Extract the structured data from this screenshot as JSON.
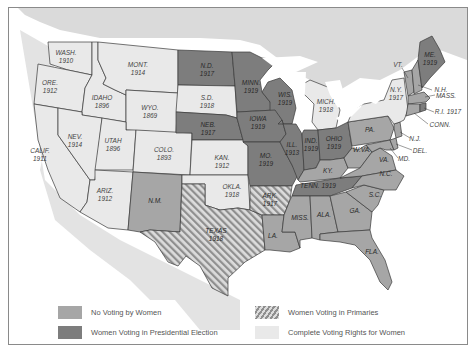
{
  "map": {
    "title": "Women's Suffrage in the United States before 1920",
    "colors": {
      "background": "#ffffff",
      "land_outside": "#d9d9d9",
      "water": "#ffffff",
      "no_voting": "#a6a6a6",
      "presidential": "#7d7d7d",
      "primaries_base": "#d0d0d0",
      "primaries_stripe": "#8f8f8f",
      "complete": "#e9e9e9",
      "border": "#3a3a3a"
    },
    "states": [
      {
        "abbr": "WASH.",
        "year": "1910",
        "status": "complete"
      },
      {
        "abbr": "ORE.",
        "year": "1912",
        "status": "complete"
      },
      {
        "abbr": "CALIF.",
        "year": "1911",
        "status": "complete"
      },
      {
        "abbr": "IDAHO",
        "year": "1896",
        "status": "complete"
      },
      {
        "abbr": "NEV.",
        "year": "1914",
        "status": "complete"
      },
      {
        "abbr": "MONT.",
        "year": "1914",
        "status": "complete"
      },
      {
        "abbr": "WYO.",
        "year": "1869",
        "status": "complete"
      },
      {
        "abbr": "UTAH",
        "year": "1896",
        "status": "complete"
      },
      {
        "abbr": "COLO.",
        "year": "1893",
        "status": "complete"
      },
      {
        "abbr": "ARIZ.",
        "year": "1912",
        "status": "complete"
      },
      {
        "abbr": "N.M.",
        "year": "",
        "status": "no_voting"
      },
      {
        "abbr": "N.D.",
        "year": "1917",
        "status": "presidential"
      },
      {
        "abbr": "S.D.",
        "year": "1918",
        "status": "complete"
      },
      {
        "abbr": "NEB.",
        "year": "1917",
        "status": "presidential"
      },
      {
        "abbr": "KAN.",
        "year": "1912",
        "status": "complete"
      },
      {
        "abbr": "OKLA.",
        "year": "1918",
        "status": "complete"
      },
      {
        "abbr": "TEXAS",
        "year": "1918",
        "status": "primaries"
      },
      {
        "abbr": "MINN.",
        "year": "1919",
        "status": "presidential"
      },
      {
        "abbr": "IOWA",
        "year": "1919",
        "status": "presidential"
      },
      {
        "abbr": "MO.",
        "year": "1919",
        "status": "presidential"
      },
      {
        "abbr": "ARK.",
        "year": "1917",
        "status": "primaries"
      },
      {
        "abbr": "LA.",
        "year": "",
        "status": "no_voting"
      },
      {
        "abbr": "WIS.",
        "year": "1919",
        "status": "presidential"
      },
      {
        "abbr": "ILL.",
        "year": "1913",
        "status": "presidential"
      },
      {
        "abbr": "MICH.",
        "year": "1918",
        "status": "complete"
      },
      {
        "abbr": "IND.",
        "year": "1919",
        "status": "presidential"
      },
      {
        "abbr": "OHIO",
        "year": "1919",
        "status": "presidential"
      },
      {
        "abbr": "KY.",
        "year": "",
        "status": "no_voting"
      },
      {
        "abbr": "TENN.",
        "year": "1919",
        "status": "presidential"
      },
      {
        "abbr": "MISS.",
        "year": "",
        "status": "no_voting"
      },
      {
        "abbr": "ALA.",
        "year": "",
        "status": "no_voting"
      },
      {
        "abbr": "GA.",
        "year": "",
        "status": "no_voting"
      },
      {
        "abbr": "FLA.",
        "year": "",
        "status": "no_voting"
      },
      {
        "abbr": "S.C.",
        "year": "",
        "status": "no_voting"
      },
      {
        "abbr": "N.C.",
        "year": "",
        "status": "no_voting"
      },
      {
        "abbr": "VA.",
        "year": "",
        "status": "no_voting"
      },
      {
        "abbr": "W.VA.",
        "year": "",
        "status": "no_voting"
      },
      {
        "abbr": "PA.",
        "year": "",
        "status": "no_voting"
      },
      {
        "abbr": "N.Y.",
        "year": "1917",
        "status": "complete"
      },
      {
        "abbr": "VT.",
        "year": "",
        "status": "no_voting"
      },
      {
        "abbr": "N.H.",
        "year": "",
        "status": "no_voting"
      },
      {
        "abbr": "ME.",
        "year": "1919",
        "status": "presidential"
      },
      {
        "abbr": "MASS.",
        "year": "",
        "status": "no_voting"
      },
      {
        "abbr": "R.I.",
        "year": "1917",
        "status": "presidential"
      },
      {
        "abbr": "CONN.",
        "year": "",
        "status": "no_voting"
      },
      {
        "abbr": "N.J.",
        "year": "",
        "status": "no_voting"
      },
      {
        "abbr": "DEL.",
        "year": "",
        "status": "no_voting"
      },
      {
        "abbr": "MD.",
        "year": "",
        "status": "no_voting"
      }
    ],
    "labels": {
      "wash": [
        "WASH.",
        "1910"
      ],
      "ore": [
        "ORE.",
        "1912"
      ],
      "calif": [
        "CALIF.",
        "1911"
      ],
      "idaho": [
        "IDAHO",
        "1896"
      ],
      "nev": [
        "NEV.",
        "1914"
      ],
      "mont": [
        "MONT.",
        "1914"
      ],
      "wyo": [
        "WYO.",
        "1869"
      ],
      "utah": [
        "UTAH",
        "1896"
      ],
      "colo": [
        "COLO.",
        "1893"
      ],
      "ariz": [
        "ARIZ.",
        "1912"
      ],
      "nm": [
        "N.M."
      ],
      "nd": [
        "N.D.",
        "1917"
      ],
      "sd": [
        "S.D.",
        "1918"
      ],
      "neb": [
        "NEB.",
        "1917"
      ],
      "kan": [
        "KAN.",
        "1912"
      ],
      "okla": [
        "OKLA.",
        "1918"
      ],
      "texas": [
        "TEXAS",
        "1918"
      ],
      "minn": [
        "MINN.",
        "1919"
      ],
      "iowa": [
        "IOWA",
        "1919"
      ],
      "mo": [
        "MO.",
        "1919"
      ],
      "ark": [
        "ARK.",
        "1917"
      ],
      "la": [
        "LA."
      ],
      "wis": [
        "WIS.",
        "1919"
      ],
      "ill": [
        "ILL.",
        "1913"
      ],
      "mich": [
        "MICH.",
        "1918"
      ],
      "ind": [
        "IND.",
        "1919"
      ],
      "ohio": [
        "OHIO",
        "1919"
      ],
      "ky": [
        "KY."
      ],
      "tenn": [
        "TENN. 1919"
      ],
      "miss": [
        "MISS."
      ],
      "ala": [
        "ALA."
      ],
      "ga": [
        "GA."
      ],
      "fla": [
        "FLA."
      ],
      "sc": [
        "S.C."
      ],
      "nc": [
        "N.C."
      ],
      "va": [
        "VA."
      ],
      "wva": [
        "W.VA."
      ],
      "pa": [
        "PA."
      ],
      "ny": [
        "N.Y.",
        "1917"
      ],
      "vt": [
        "VT."
      ],
      "nh": [
        "N.H."
      ],
      "me": [
        "ME.",
        "1919"
      ],
      "mass": [
        "MASS."
      ],
      "ri": [
        "R.I. 1917"
      ],
      "conn": [
        "CONN."
      ],
      "nj": [
        "N.J."
      ],
      "del": [
        "DEL."
      ],
      "md": [
        "MD."
      ]
    }
  },
  "legend": {
    "items": [
      {
        "label": "No Voting by Women",
        "swatch": "no_voting"
      },
      {
        "label": "Women Voting in Presidential Election",
        "swatch": "presidential"
      },
      {
        "label": "Women Voting in Primaries",
        "swatch": "primaries"
      },
      {
        "label": "Complete Voting Rights for Women",
        "swatch": "complete"
      }
    ]
  }
}
